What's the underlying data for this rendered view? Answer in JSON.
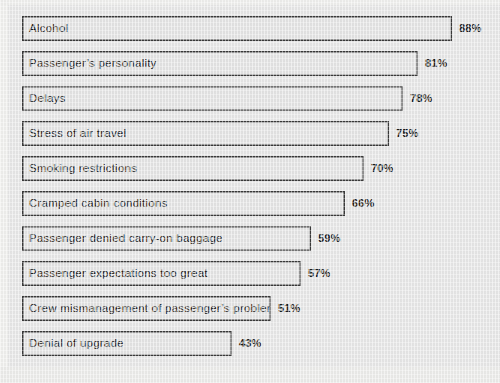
{
  "chart_data": {
    "type": "bar",
    "orientation": "horizontal",
    "title": "",
    "xlabel": "",
    "ylabel": "",
    "xlim": [
      0,
      100
    ],
    "grid": false,
    "legend": null,
    "value_suffix": "%",
    "categories": [
      "Alcohol",
      "Passenger’s personality",
      "Delays",
      "Stress of air travel",
      "Smoking restrictions",
      "Cramped cabin conditions",
      "Passenger denied carry-on baggage",
      "Passenger expectations too great",
      "Crew mismanagement of passenger’s problems",
      "Denial of upgrade"
    ],
    "values": [
      88,
      81,
      78,
      75,
      70,
      66,
      59,
      57,
      51,
      43
    ],
    "value_labels": [
      "88%",
      "81%",
      "78%",
      "75%",
      "70%",
      "66%",
      "59%",
      "57%",
      "51%",
      "43%"
    ],
    "bars": [
      {
        "label": "Alcohol",
        "value": 88,
        "value_label": "88%"
      },
      {
        "label": "Passenger’s personality",
        "value": 81,
        "value_label": "81%"
      },
      {
        "label": "Delays",
        "value": 78,
        "value_label": "78%"
      },
      {
        "label": "Stress of air travel",
        "value": 75,
        "value_label": "75%"
      },
      {
        "label": "Smoking restrictions",
        "value": 70,
        "value_label": "70%"
      },
      {
        "label": "Cramped cabin conditions",
        "value": 66,
        "value_label": "66%"
      },
      {
        "label": "Passenger denied carry-on baggage",
        "value": 59,
        "value_label": "59%"
      },
      {
        "label": "Passenger expectations too great",
        "value": 57,
        "value_label": "57%"
      },
      {
        "label": "Crew mismanagement of passenger’s problems",
        "value": 51,
        "value_label": "51%"
      },
      {
        "label": "Denial of upgrade",
        "value": 43,
        "value_label": "43%"
      }
    ],
    "colors": {
      "background": "#e7e7e7",
      "bar_fill": "#e4e4e4",
      "bar_border": "#3a3a3a",
      "text": "#1d1d1d"
    }
  },
  "layout": {
    "bar_origin_x": 22,
    "first_bar_top": 16,
    "row_pitch": 35,
    "bar_height": 25,
    "px_per_percent": 4.89
  }
}
